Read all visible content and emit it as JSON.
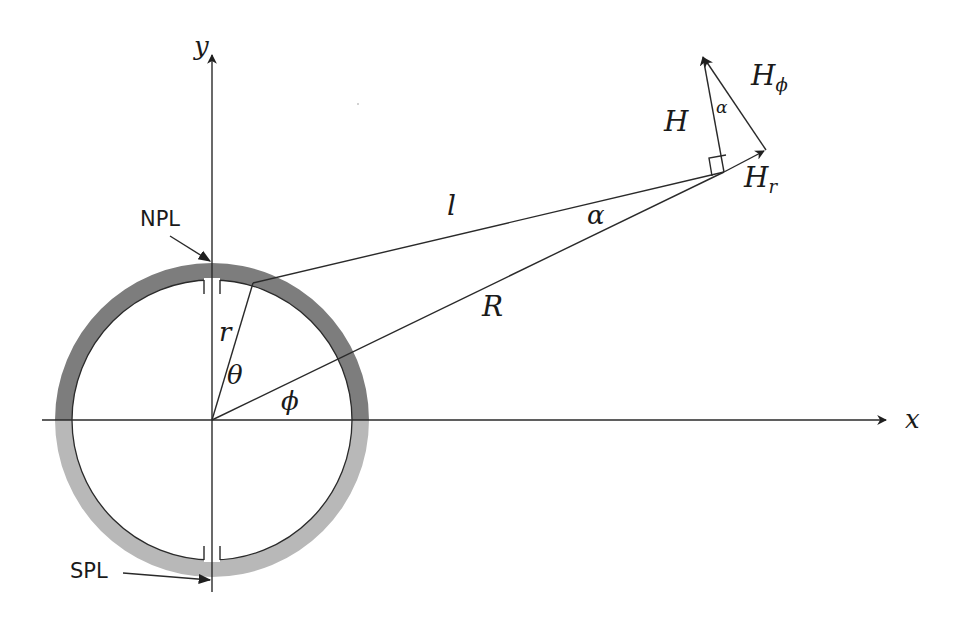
{
  "diagram": {
    "axes": {
      "x_label": "x",
      "y_label": "y"
    },
    "ring": {
      "center": [
        212,
        420
      ],
      "inner_radius": 140,
      "outer_radius": 157,
      "upper_color": "#7a7a7a",
      "lower_color": "#b4b4b4"
    },
    "labels": {
      "npl": "NPL",
      "spl": "SPL",
      "r": "r",
      "theta": "θ",
      "phi": "ϕ",
      "l": "l",
      "R": "R",
      "alpha_main": "α",
      "alpha_small": "α",
      "H": "H",
      "H_phi_base": "H",
      "H_phi_sub": "ϕ",
      "H_r_base": "H",
      "H_r_sub": "r"
    },
    "points": {
      "origin": [
        212,
        420
      ],
      "source_on_ring": [
        253,
        283
      ],
      "field_point": [
        724,
        172
      ],
      "H_tip": [
        702,
        55
      ],
      "H_r_tip": [
        765,
        151
      ]
    }
  }
}
